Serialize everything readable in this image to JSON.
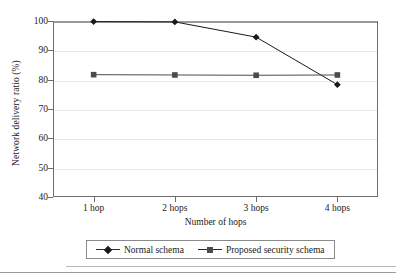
{
  "chart_data": {
    "type": "line",
    "title": "",
    "xlabel": "Number of hops",
    "ylabel": "Network delivery ratio (%)",
    "categories": [
      "1 hop",
      "2 hops",
      "3 hops",
      "4 hops"
    ],
    "ylim": [
      40,
      100
    ],
    "yticks": [
      40,
      50,
      60,
      70,
      80,
      90,
      100
    ],
    "ytick_labels": [
      "40",
      "50",
      "60",
      "70",
      "80",
      "90",
      "100"
    ],
    "grid": "horizontal",
    "legend_position": "bottom-center",
    "series": [
      {
        "name": "Normal schema",
        "marker": "diamond",
        "color": "#1a1a1a",
        "values": [
          99.8,
          99.7,
          94.5,
          78.3
        ]
      },
      {
        "name": "Proposed security schema",
        "marker": "square",
        "color": "#4b4b4b",
        "values": [
          81.7,
          81.6,
          81.5,
          81.6
        ]
      }
    ]
  },
  "legend": {
    "entries": [
      {
        "label": "Normal schema"
      },
      {
        "label": "Proposed security schema"
      }
    ]
  }
}
